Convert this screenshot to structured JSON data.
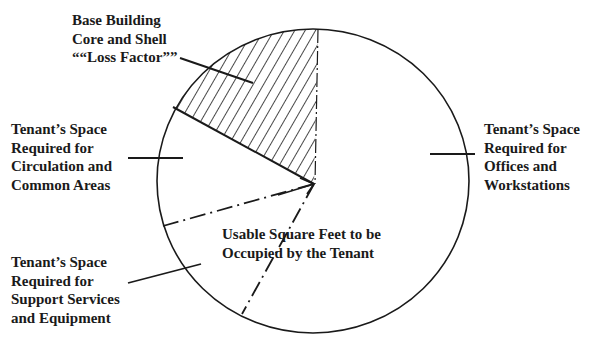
{
  "diagram": {
    "type": "pie-diagram",
    "title_cropped": "",
    "colors": {
      "line": "#1a1a1a",
      "background": "#ffffff",
      "hatch": "#1a1a1a"
    },
    "labels": {
      "loss_factor": {
        "lines": [
          "Base Building",
          "Core and Shell",
          "““Loss Factor””"
        ]
      },
      "circulation": {
        "lines": [
          "Tenant’s Space",
          "Required for",
          "Circulation and",
          "Common Areas"
        ]
      },
      "support": {
        "lines": [
          "Tenant’s Space",
          "Required for",
          "Support Services",
          "and Equipment"
        ]
      },
      "offices": {
        "lines": [
          "Tenant’s Space",
          "Required for",
          "Offices and",
          "Workstations"
        ]
      },
      "usable": {
        "lines": [
          "Usable Square Feet to be",
          "Occupied by the Tenant"
        ]
      }
    },
    "segments": [
      {
        "name": "Base Building Core and Shell Loss Factor",
        "style": "hatched"
      },
      {
        "name": "Tenant's Space Required for Circulation and Common Areas",
        "style": "plain"
      },
      {
        "name": "Tenant's Space Required for Support Services and Equipment",
        "style": "plain"
      },
      {
        "name": "Tenant's Space Required for Offices and Workstations",
        "style": "plain"
      }
    ]
  }
}
